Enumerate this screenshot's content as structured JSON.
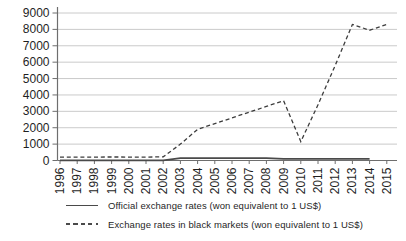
{
  "chart_data": {
    "type": "line",
    "title": "",
    "xlabel": "",
    "ylabel": "",
    "categories": [
      "1996",
      "1997",
      "1998",
      "1999",
      "2000",
      "2001",
      "2002",
      "2003",
      "2004",
      "2005",
      "2006",
      "2007",
      "2008",
      "2009",
      "2010",
      "2011",
      "2012",
      "2013",
      "2014",
      "2015"
    ],
    "series": [
      {
        "name": "Official exchange rates (won equivalent to 1 US$)",
        "style": "solid",
        "color": "#4a4a4a",
        "values": [
          5,
          5,
          5,
          5,
          5,
          5,
          5,
          150,
          150,
          150,
          150,
          150,
          150,
          100,
          100,
          100,
          100,
          100,
          100,
          null
        ]
      },
      {
        "name": "Exchange rates in black markets (won equivalent to 1 US$)",
        "style": "dashed",
        "color": "#3d3d3d",
        "values": [
          200,
          200,
          210,
          215,
          210,
          210,
          220,
          1000,
          1900,
          2250,
          2600,
          2950,
          3300,
          3650,
          1150,
          3400,
          5800,
          8300,
          7950,
          8300
        ]
      }
    ],
    "ylim": [
      0,
      9000
    ],
    "y_ticks": [
      0,
      1000,
      2000,
      3000,
      4000,
      5000,
      6000,
      7000,
      8000,
      9000
    ],
    "grid": "horizontal",
    "legend_position": "bottom",
    "x_tick_label_rotation": -90
  },
  "colors": {
    "background": "#ffffff",
    "gridline": "#c4c4c4",
    "axis": "#6e6e6e",
    "tick_text": "#1f1f1f",
    "official_line": "#4a4a4a",
    "black_market_line": "#3d3d3d"
  }
}
